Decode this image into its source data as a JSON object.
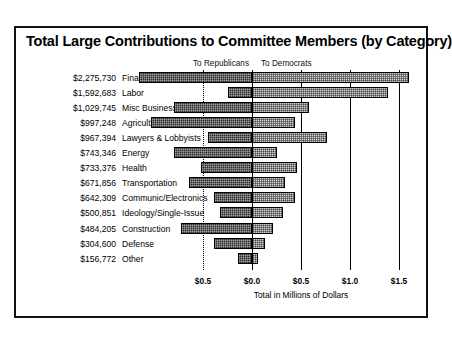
{
  "chart_data": {
    "type": "bar",
    "orientation": "horizontal",
    "stacked": "diverging",
    "title": "Total Large Contributions to Committee Members (by Category)",
    "xlabel": "Total in Millions of Dollars",
    "ylabel": "",
    "grid": true,
    "legend_position": "top",
    "legend": [
      "To Republicans",
      "To Democrats"
    ],
    "xtick_labels": [
      "$0.5",
      "$0.0",
      "$0.5",
      "$1.0",
      "$1.5"
    ],
    "xtick_values": [
      -0.5,
      0.0,
      0.5,
      1.0,
      1.5
    ],
    "xlim": [
      -1.25,
      1.75
    ],
    "categories": [
      "Finance/Insur/Real Est",
      "Labor",
      "Misc Business",
      "Agriculture",
      "Lawyers & Lobbyists",
      "Energy",
      "Health",
      "Transportation",
      "Communic/Electronics",
      "Ideology/Single-Issue",
      "Construction",
      "Defense",
      "Other"
    ],
    "totals_labels": [
      "$2,275,730",
      "$1,592,683",
      "$1,029,745",
      "$997,248",
      "$967,394",
      "$743,346",
      "$733,376",
      "$671,856",
      "$642,309",
      "$500,851",
      "$484,205",
      "$304,600",
      "$156,772"
    ],
    "totals_values": [
      2275730,
      1592683,
      1029745,
      997248,
      967394,
      743346,
      733376,
      671856,
      642309,
      500851,
      484205,
      304600,
      156772
    ],
    "series": [
      {
        "name": "To Republicans",
        "color": "#2b2b2b",
        "values": [
          -1.15,
          -0.25,
          -0.8,
          -1.03,
          -0.45,
          -0.8,
          -0.52,
          -0.64,
          -0.39,
          -0.33,
          -0.72,
          -0.39,
          -0.14
        ]
      },
      {
        "name": "To Democrats",
        "color": "#d0d0d0",
        "values": [
          1.6,
          1.39,
          0.58,
          0.44,
          0.77,
          0.26,
          0.46,
          0.34,
          0.44,
          0.32,
          0.21,
          0.13,
          0.06
        ]
      }
    ]
  }
}
